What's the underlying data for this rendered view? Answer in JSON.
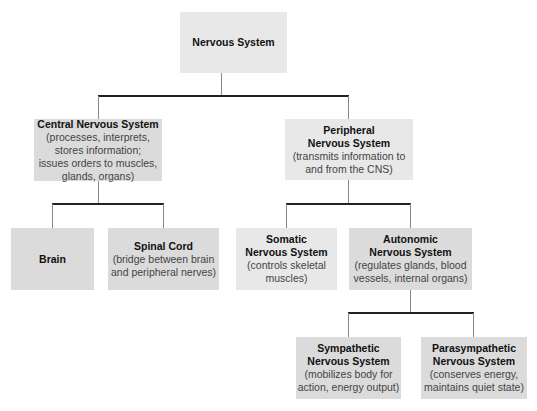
{
  "diagram": {
    "type": "hierarchy",
    "title": "Nervous System",
    "nodes": {
      "root": {
        "title": "Nervous System",
        "desc": ""
      },
      "cns": {
        "title": "Central Nervous System",
        "desc": "(processes, interprets,\nstores information;\nissues orders to muscles,\nglands, organs)"
      },
      "pns": {
        "title": "Peripheral\nNervous System",
        "desc": "(transmits information to\nand from the CNS)"
      },
      "brain": {
        "title": "Brain",
        "desc": ""
      },
      "spinal": {
        "title": "Spinal Cord",
        "desc": "(bridge between brain\nand peripheral nerves)"
      },
      "somatic": {
        "title": "Somatic\nNervous System",
        "desc": "(controls skeletal\nmuscles)"
      },
      "autonomic": {
        "title": "Autonomic\nNervous System",
        "desc": "(regulates glands, blood\nvessels, internal organs)"
      },
      "sympathetic": {
        "title": "Sympathetic\nNervous System",
        "desc": "(mobilizes body for\naction, energy output)"
      },
      "parasympathetic": {
        "title": "Parasympathetic\nNervous System",
        "desc": "(conserves energy,\nmaintains quiet state)"
      }
    },
    "edges": [
      [
        "root",
        "cns"
      ],
      [
        "root",
        "pns"
      ],
      [
        "cns",
        "brain"
      ],
      [
        "cns",
        "spinal"
      ],
      [
        "pns",
        "somatic"
      ],
      [
        "pns",
        "autonomic"
      ],
      [
        "autonomic",
        "sympathetic"
      ],
      [
        "autonomic",
        "parasympathetic"
      ]
    ],
    "colors": {
      "light_box": "#e8e8e8",
      "dark_box": "#dbdbdb",
      "connector": "#222222"
    }
  }
}
